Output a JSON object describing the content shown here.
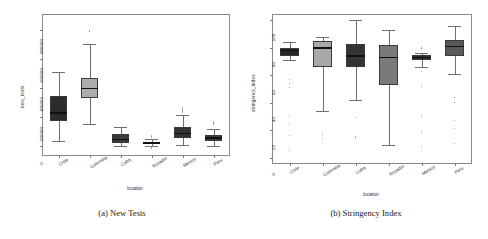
{
  "figure": {
    "panels": [
      {
        "caption": "(a) New Tests",
        "chart_data": {
          "type": "box",
          "title": "",
          "xlabel": "location",
          "ylabel": "new_tests",
          "categories": [
            "Chile",
            "Colombia",
            "Cuba",
            "Ecuador",
            "Mexico",
            "Peru"
          ],
          "ylim": [
            -60000,
            900000
          ],
          "yticks": [
            0,
            200000,
            400000,
            600000,
            800000
          ],
          "ytick_labels": [
            "0",
            "200000",
            "400000",
            "600000",
            "800000"
          ],
          "grid": false,
          "legend": "none",
          "boxes": [
            {
              "name": "Chile",
              "color": "#2b2b2b",
              "q1": 175000,
              "median": 228000,
              "q3": 345000,
              "whisker_low": 35000,
              "whisker_high": 510000,
              "outliers": []
            },
            {
              "name": "Colombia",
              "color": "#adadad",
              "q1": 330000,
              "median": 395000,
              "q3": 470000,
              "whisker_low": 155000,
              "whisker_high": 700000,
              "outliers": [
                790000
              ]
            },
            {
              "name": "Cuba",
              "color": "#3a3a3a",
              "q1": 22000,
              "median": 48000,
              "q3": 82000,
              "whisker_low": 2000,
              "whisker_high": 130000,
              "outliers": []
            },
            {
              "name": "Ecuador",
              "color": "#4a4a4a",
              "q1": 14000,
              "median": 22000,
              "q3": 31000,
              "whisker_low": 1500,
              "whisker_high": 52000,
              "outliers": [
                70000,
                60000,
                -12000
              ]
            },
            {
              "name": "Mexico",
              "color": "#333333",
              "q1": 55000,
              "median": 88000,
              "q3": 130000,
              "whisker_low": 6000,
              "whisker_high": 215000,
              "outliers": [
                265000,
                255000,
                242000,
                232000
              ]
            },
            {
              "name": "Peru",
              "color": "#3a3a3a",
              "q1": 34000,
              "median": 56000,
              "q3": 80000,
              "whisker_low": 3000,
              "whisker_high": 118000,
              "outliers": [
                172000,
                160000,
                150000
              ]
            }
          ]
        }
      },
      {
        "caption": "(b) Stringency Index",
        "chart_data": {
          "type": "box",
          "title": "",
          "xlabel": "location",
          "ylabel": "stringency_index",
          "categories": [
            "Chile",
            "Colombia",
            "Cuba",
            "Ecuador",
            "Mexico",
            "Peru"
          ],
          "ylim": [
            -4,
            104
          ],
          "yticks": [
            0,
            20,
            40,
            60,
            80,
            100
          ],
          "ytick_labels": [
            "0",
            "20",
            "40",
            "60",
            "80",
            "100"
          ],
          "grid": false,
          "legend": "none",
          "boxes": [
            {
              "name": "Chile",
              "color": "#262626",
              "q1": 74,
              "median": 78,
              "q3": 80,
              "whisker_low": 71,
              "whisker_high": 84,
              "outliers": [
                57,
                54,
                51,
                30,
                24,
                16,
                5
              ]
            },
            {
              "name": "Colombia",
              "color": "#a9a9a9",
              "q1": 66,
              "median": 80,
              "q3": 85,
              "whisker_low": 34,
              "whisker_high": 88,
              "outliers": [
                17,
                14
              ]
            },
            {
              "name": "Cuba",
              "color": "#343434",
              "q1": 66,
              "median": 74,
              "q3": 83,
              "whisker_low": 42,
              "whisker_high": 100,
              "outliers": [
                29,
                15
              ]
            },
            {
              "name": "Ecuador",
              "color": "#7a7a7a",
              "q1": 53,
              "median": 73,
              "q3": 82,
              "whisker_low": 9,
              "whisker_high": 93,
              "outliers": []
            },
            {
              "name": "Mexico",
              "color": "#2e2e2e",
              "q1": 71,
              "median": 73,
              "q3": 75,
              "whisker_low": 66,
              "whisker_high": 76,
              "outliers": [
                80,
                63,
                52,
                30,
                18,
                8
              ]
            },
            {
              "name": "Peru",
              "color": "#595959",
              "q1": 74,
              "median": 81,
              "q3": 86,
              "whisker_low": 61,
              "whisker_high": 96,
              "outliers": [
                44,
                40,
                27,
                21,
                10
              ]
            }
          ]
        }
      }
    ]
  }
}
